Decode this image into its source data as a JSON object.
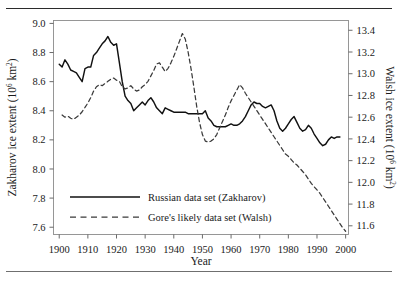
{
  "chart_data": {
    "type": "line",
    "title": "",
    "xlabel": "Year",
    "ylabel": "Zakharov ice extent (10⁶ km²)",
    "y2label": "Walsh ice extent (10⁶ km²)",
    "xlim": [
      1898,
      2001
    ],
    "ylim": [
      7.55,
      9.02
    ],
    "y2lim": [
      11.52,
      13.49
    ],
    "grid": false,
    "legend_position": "lower-left-inside",
    "xticks": [
      1900,
      1910,
      1920,
      1930,
      1940,
      1950,
      1960,
      1970,
      1980,
      1990,
      2000
    ],
    "xtick_labels": [
      "1900",
      "1910",
      "1920",
      "1930",
      "1940",
      "1950",
      "1960",
      "1970",
      "1980",
      "1990",
      "2000"
    ],
    "yticks": [
      7.6,
      7.8,
      8.0,
      8.2,
      8.4,
      8.6,
      8.8,
      9.0
    ],
    "ytick_labels": [
      "7.6",
      "7.8",
      "8.0",
      "8.2",
      "8.4",
      "8.6",
      "8.8",
      "9.0"
    ],
    "y2ticks": [
      11.6,
      11.8,
      12.0,
      12.2,
      12.4,
      12.6,
      12.8,
      13.0,
      13.2,
      13.4
    ],
    "y2tick_labels": [
      "11.6",
      "11.8",
      "12.0",
      "12.2",
      "12.4",
      "12.6",
      "12.8",
      "13.0",
      "13.2",
      "13.4"
    ],
    "series": [
      {
        "name": "Russian data set (Zakharov)",
        "style": "solid",
        "color": "#111111",
        "axis": "left",
        "x": [
          1900,
          1901,
          1902,
          1903,
          1904,
          1905,
          1906,
          1907,
          1908,
          1909,
          1910,
          1911,
          1912,
          1913,
          1914,
          1915,
          1916,
          1917,
          1918,
          1919,
          1920,
          1921,
          1922,
          1923,
          1924,
          1925,
          1926,
          1927,
          1928,
          1929,
          1930,
          1931,
          1932,
          1933,
          1934,
          1935,
          1936,
          1937,
          1938,
          1939,
          1940,
          1941,
          1942,
          1943,
          1944,
          1945,
          1946,
          1947,
          1948,
          1949,
          1950,
          1951,
          1952,
          1953,
          1954,
          1955,
          1956,
          1957,
          1958,
          1959,
          1960,
          1961,
          1962,
          1963,
          1964,
          1965,
          1966,
          1967,
          1968,
          1969,
          1970,
          1971,
          1972,
          1973,
          1974,
          1975,
          1976,
          1977,
          1978,
          1979,
          1980,
          1981,
          1982,
          1983,
          1984,
          1985,
          1986,
          1987,
          1988,
          1989,
          1990,
          1991,
          1992,
          1993,
          1994,
          1995,
          1996,
          1997,
          1998
        ],
        "y": [
          8.72,
          8.7,
          8.75,
          8.72,
          8.68,
          8.67,
          8.66,
          8.63,
          8.6,
          8.69,
          8.7,
          8.7,
          8.78,
          8.8,
          8.83,
          8.86,
          8.88,
          8.91,
          8.87,
          8.85,
          8.86,
          8.73,
          8.6,
          8.5,
          8.47,
          8.45,
          8.4,
          8.42,
          8.44,
          8.46,
          8.44,
          8.47,
          8.49,
          8.46,
          8.42,
          8.4,
          8.38,
          8.42,
          8.41,
          8.4,
          8.39,
          8.39,
          8.39,
          8.39,
          8.39,
          8.38,
          8.38,
          8.38,
          8.38,
          8.38,
          8.38,
          8.4,
          8.35,
          8.33,
          8.3,
          8.29,
          8.29,
          8.29,
          8.29,
          8.3,
          8.31,
          8.3,
          8.3,
          8.31,
          8.33,
          8.36,
          8.4,
          8.44,
          8.46,
          8.45,
          8.45,
          8.43,
          8.42,
          8.43,
          8.44,
          8.4,
          8.33,
          8.28,
          8.26,
          8.28,
          8.31,
          8.34,
          8.36,
          8.32,
          8.28,
          8.26,
          8.27,
          8.3,
          8.28,
          8.24,
          8.21,
          8.18,
          8.16,
          8.17,
          8.2,
          8.22,
          8.21,
          8.22,
          8.22
        ]
      },
      {
        "name": "Gore's likely data set (Walsh)",
        "style": "dashed",
        "color": "#3a3a3a",
        "axis": "right",
        "x": [
          1901,
          1902,
          1903,
          1904,
          1905,
          1906,
          1907,
          1908,
          1909,
          1910,
          1911,
          1912,
          1913,
          1914,
          1915,
          1916,
          1917,
          1918,
          1919,
          1920,
          1921,
          1922,
          1923,
          1924,
          1925,
          1926,
          1927,
          1928,
          1929,
          1930,
          1931,
          1932,
          1933,
          1934,
          1935,
          1936,
          1937,
          1938,
          1939,
          1940,
          1941,
          1942,
          1943,
          1944,
          1945,
          1946,
          1947,
          1948,
          1949,
          1950,
          1951,
          1952,
          1953,
          1954,
          1955,
          1956,
          1957,
          1958,
          1959,
          1960,
          1961,
          1962,
          1963,
          1964,
          1965,
          1966,
          1967,
          1968,
          1969,
          1970,
          1971,
          1972,
          1973,
          1974,
          1975,
          1976,
          1977,
          1978,
          1979,
          1980,
          1981,
          1982,
          1983,
          1984,
          1985,
          1986,
          1987,
          1988,
          1989,
          1990,
          1991,
          1992,
          1993,
          1994,
          1995,
          1996,
          1997,
          1998,
          1999,
          2000
        ],
        "y": [
          12.62,
          12.6,
          12.61,
          12.59,
          12.58,
          12.6,
          12.62,
          12.65,
          12.69,
          12.73,
          12.78,
          12.84,
          12.88,
          12.9,
          12.89,
          12.91,
          12.93,
          12.95,
          12.96,
          12.94,
          12.93,
          12.88,
          12.86,
          12.87,
          12.89,
          12.86,
          12.84,
          12.85,
          12.88,
          12.9,
          12.93,
          12.98,
          13.03,
          13.09,
          13.1,
          13.06,
          13.02,
          13.05,
          13.1,
          13.16,
          13.23,
          13.3,
          13.37,
          13.32,
          13.2,
          13.05,
          12.88,
          12.7,
          12.55,
          12.44,
          12.38,
          12.37,
          12.38,
          12.4,
          12.44,
          12.5,
          12.56,
          12.62,
          12.69,
          12.75,
          12.8,
          12.85,
          12.9,
          12.87,
          12.82,
          12.78,
          12.74,
          12.7,
          12.66,
          12.62,
          12.58,
          12.54,
          12.5,
          12.46,
          12.42,
          12.38,
          12.34,
          12.3,
          12.26,
          12.24,
          12.21,
          12.18,
          12.16,
          12.13,
          12.1,
          12.07,
          12.03,
          11.99,
          11.96,
          11.93,
          11.9,
          11.86,
          11.82,
          11.78,
          11.74,
          11.7,
          11.66,
          11.62,
          11.58,
          11.55
        ]
      }
    ]
  },
  "legend": {
    "items": [
      {
        "label": "Russian data set (Zakharov)",
        "style": "solid"
      },
      {
        "label": "Gore's likely data set (Walsh)",
        "style": "dashed"
      }
    ]
  },
  "axis_titles": {
    "left_main": "Zakharov ice extent (10",
    "left_sup": "6",
    "left_tail": " km",
    "left_sup2": "2",
    "left_close": ")",
    "right_main": "Walsh ice extent (10",
    "right_sup": "6",
    "right_tail": " km",
    "right_sup2": "2",
    "right_close": ")",
    "bottom": "Year"
  }
}
